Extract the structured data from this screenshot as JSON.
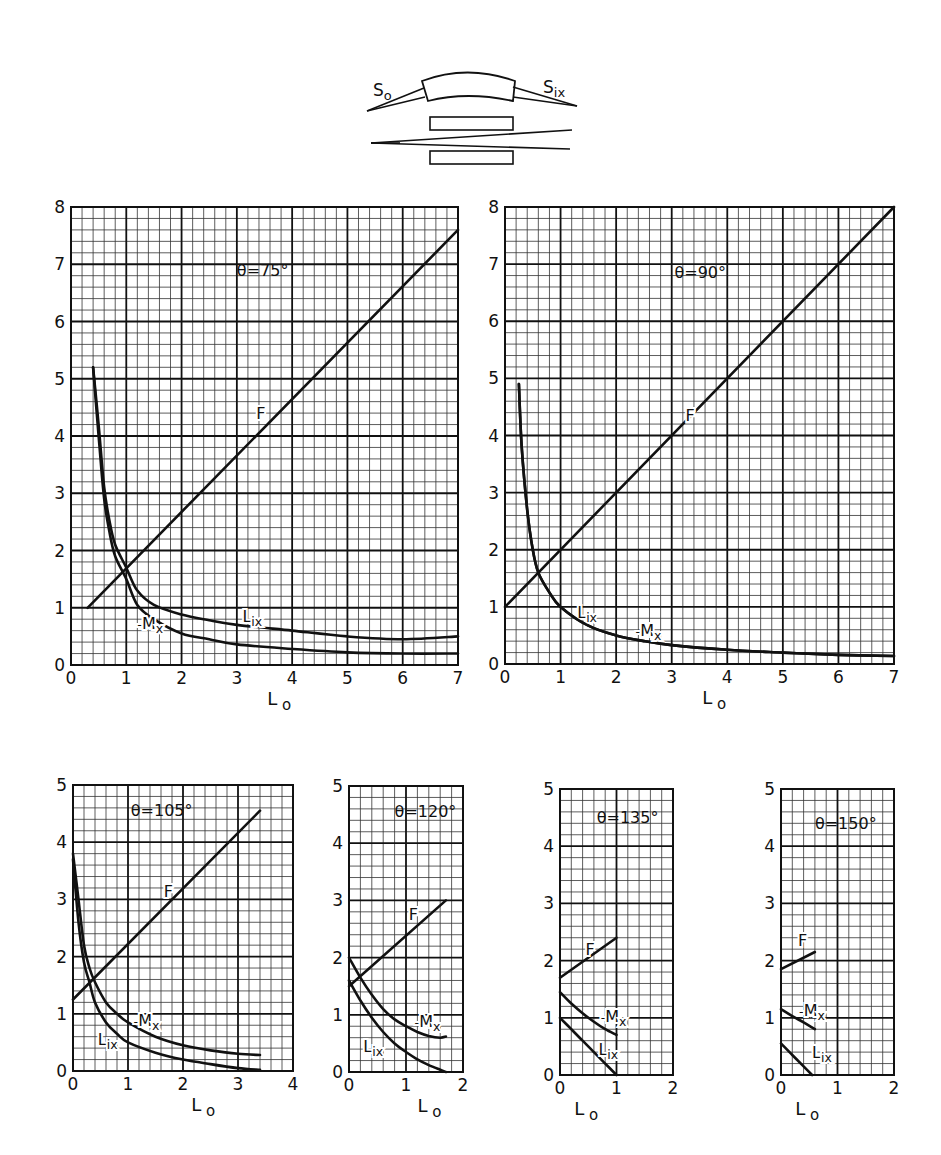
{
  "figure": {
    "width": 941,
    "height": 1155,
    "ink_color": "#111111",
    "background": "#ffffff"
  },
  "schematic": {
    "label_source": "S",
    "label_source_sub": "o",
    "label_image": "S",
    "label_image_sub": "ix"
  },
  "chart_data": [
    {
      "type": "line",
      "id": "theta75",
      "title": "θ=75°",
      "title_pos": [
        3.0,
        6.8
      ],
      "xlabel": "L",
      "xlabel_sub": "o",
      "ylabel": "",
      "xlim": [
        0,
        7
      ],
      "ylim": [
        0,
        8
      ],
      "xticks": [
        0,
        1,
        2,
        3,
        4,
        5,
        6,
        7
      ],
      "yticks": [
        0,
        1,
        2,
        3,
        4,
        5,
        6,
        7,
        8
      ],
      "minor_per_major": 5,
      "grid": true,
      "frame": [
        71,
        207,
        458,
        665
      ],
      "series": [
        {
          "name": "F",
          "label_pos": [
            3.35,
            4.3
          ],
          "points": [
            [
              0.3,
              1.0
            ],
            [
              7.0,
              7.6
            ]
          ]
        },
        {
          "name": "L_ix",
          "label_pos": [
            3.1,
            0.75
          ],
          "points": [
            [
              0.4,
              5.2
            ],
            [
              0.5,
              4.2
            ],
            [
              0.6,
              3.1
            ],
            [
              0.7,
              2.5
            ],
            [
              0.8,
              2.1
            ],
            [
              1.0,
              1.7
            ],
            [
              1.2,
              1.3
            ],
            [
              1.5,
              1.05
            ],
            [
              2.0,
              0.88
            ],
            [
              2.5,
              0.78
            ],
            [
              3.0,
              0.7
            ],
            [
              4.0,
              0.6
            ],
            [
              5.0,
              0.5
            ],
            [
              6.0,
              0.45
            ],
            [
              7.0,
              0.5
            ]
          ]
        },
        {
          "name": "-M_x",
          "label_pos": [
            1.2,
            0.6
          ],
          "points": [
            [
              0.4,
              5.2
            ],
            [
              0.5,
              4.0
            ],
            [
              0.6,
              2.9
            ],
            [
              0.7,
              2.3
            ],
            [
              0.8,
              1.9
            ],
            [
              1.0,
              1.5
            ],
            [
              1.2,
              1.05
            ],
            [
              1.5,
              0.8
            ],
            [
              2.0,
              0.55
            ],
            [
              2.5,
              0.45
            ],
            [
              3.0,
              0.36
            ],
            [
              4.0,
              0.28
            ],
            [
              5.0,
              0.22
            ],
            [
              6.0,
              0.2
            ],
            [
              7.0,
              0.2
            ]
          ]
        }
      ]
    },
    {
      "type": "line",
      "id": "theta90",
      "title": "θ=90°",
      "title_pos": [
        3.05,
        6.75
      ],
      "xlabel": "L",
      "xlabel_sub": "o",
      "ylabel": "",
      "xlim": [
        0,
        7
      ],
      "ylim": [
        0,
        8
      ],
      "xticks": [
        0,
        1,
        2,
        3,
        4,
        5,
        6,
        7
      ],
      "yticks": [
        0,
        1,
        2,
        3,
        4,
        5,
        6,
        7,
        8
      ],
      "minor_per_major": 5,
      "grid": true,
      "frame": [
        505,
        207,
        894,
        664
      ],
      "series": [
        {
          "name": "F",
          "label_pos": [
            3.25,
            4.25
          ],
          "points": [
            [
              0.0,
              1.0
            ],
            [
              7.0,
              8.0
            ]
          ]
        },
        {
          "name": "L_ix",
          "label_pos": [
            1.3,
            0.8
          ],
          "points": [
            [
              0.25,
              4.9
            ],
            [
              0.3,
              3.8
            ],
            [
              0.4,
              2.7
            ],
            [
              0.5,
              2.0
            ],
            [
              0.6,
              1.6
            ],
            [
              0.8,
              1.25
            ],
            [
              1.0,
              1.0
            ],
            [
              1.5,
              0.67
            ],
            [
              2.0,
              0.5
            ],
            [
              2.5,
              0.4
            ],
            [
              3.0,
              0.33
            ],
            [
              4.0,
              0.25
            ],
            [
              5.0,
              0.2
            ],
            [
              6.0,
              0.16
            ],
            [
              7.0,
              0.14
            ]
          ]
        },
        {
          "name": "-M_x",
          "label_pos": [
            2.35,
            0.45
          ],
          "points": [
            [
              0.25,
              4.9
            ],
            [
              0.3,
              3.8
            ],
            [
              0.4,
              2.7
            ],
            [
              0.5,
              2.0
            ],
            [
              0.6,
              1.6
            ],
            [
              0.8,
              1.25
            ],
            [
              1.0,
              1.0
            ],
            [
              1.5,
              0.67
            ],
            [
              2.0,
              0.5
            ],
            [
              2.5,
              0.4
            ],
            [
              3.0,
              0.33
            ],
            [
              4.0,
              0.25
            ],
            [
              5.0,
              0.2
            ],
            [
              6.0,
              0.16
            ],
            [
              7.0,
              0.14
            ]
          ]
        }
      ]
    },
    {
      "type": "line",
      "id": "theta105",
      "title": "θ=105°",
      "title_pos": [
        1.05,
        4.45
      ],
      "xlabel": "L",
      "xlabel_sub": "o",
      "ylabel": "",
      "xlim": [
        0,
        4
      ],
      "ylim": [
        0,
        5
      ],
      "xticks": [
        0,
        1,
        2,
        3,
        4
      ],
      "yticks": [
        0,
        1,
        2,
        3,
        4,
        5
      ],
      "minor_per_major": 5,
      "grid": true,
      "frame": [
        73,
        785,
        293,
        1071
      ],
      "series": [
        {
          "name": "F",
          "label_pos": [
            1.65,
            3.05
          ],
          "points": [
            [
              0.0,
              1.25
            ],
            [
              3.4,
              4.55
            ]
          ]
        },
        {
          "name": "-M_x",
          "label_pos": [
            1.1,
            0.75
          ],
          "points": [
            [
              0.0,
              3.8
            ],
            [
              0.1,
              3.0
            ],
            [
              0.2,
              2.2
            ],
            [
              0.3,
              1.8
            ],
            [
              0.4,
              1.55
            ],
            [
              0.6,
              1.2
            ],
            [
              0.8,
              1.0
            ],
            [
              1.0,
              0.85
            ],
            [
              1.5,
              0.6
            ],
            [
              2.0,
              0.45
            ],
            [
              2.5,
              0.36
            ],
            [
              3.0,
              0.3
            ],
            [
              3.4,
              0.28
            ]
          ]
        },
        {
          "name": "L_ix",
          "label_pos": [
            0.45,
            0.45
          ],
          "points": [
            [
              0.0,
              3.7
            ],
            [
              0.1,
              2.6
            ],
            [
              0.2,
              1.9
            ],
            [
              0.3,
              1.55
            ],
            [
              0.4,
              1.2
            ],
            [
              0.6,
              0.85
            ],
            [
              0.8,
              0.65
            ],
            [
              1.0,
              0.5
            ],
            [
              1.5,
              0.32
            ],
            [
              2.0,
              0.2
            ],
            [
              2.5,
              0.12
            ],
            [
              3.0,
              0.05
            ],
            [
              3.4,
              0.02
            ]
          ]
        }
      ]
    },
    {
      "type": "line",
      "id": "theta120",
      "title": "θ=120°",
      "title_pos": [
        0.8,
        4.45
      ],
      "xlabel": "L",
      "xlabel_sub": "o",
      "ylabel": "",
      "xlim": [
        0,
        2
      ],
      "ylim": [
        0,
        5
      ],
      "xticks": [
        0,
        1,
        2
      ],
      "yticks": [
        0,
        1,
        2,
        3,
        4,
        5
      ],
      "minor_per_major": 5,
      "grid": true,
      "frame": [
        349,
        786,
        463,
        1072
      ],
      "series": [
        {
          "name": "F",
          "label_pos": [
            1.05,
            2.65
          ],
          "points": [
            [
              0.0,
              1.5
            ],
            [
              1.7,
              3.0
            ]
          ]
        },
        {
          "name": "-M_x",
          "label_pos": [
            1.15,
            0.75
          ],
          "points": [
            [
              0.0,
              2.0
            ],
            [
              0.2,
              1.65
            ],
            [
              0.4,
              1.35
            ],
            [
              0.6,
              1.1
            ],
            [
              0.8,
              0.92
            ],
            [
              1.0,
              0.8
            ],
            [
              1.2,
              0.7
            ],
            [
              1.4,
              0.63
            ],
            [
              1.6,
              0.6
            ],
            [
              1.7,
              0.62
            ]
          ]
        },
        {
          "name": "L_ix",
          "label_pos": [
            0.25,
            0.35
          ],
          "points": [
            [
              0.0,
              1.6
            ],
            [
              0.2,
              1.25
            ],
            [
              0.4,
              0.95
            ],
            [
              0.6,
              0.7
            ],
            [
              0.8,
              0.5
            ],
            [
              1.0,
              0.35
            ],
            [
              1.2,
              0.22
            ],
            [
              1.4,
              0.12
            ],
            [
              1.6,
              0.04
            ],
            [
              1.7,
              0.0
            ]
          ]
        }
      ]
    },
    {
      "type": "line",
      "id": "theta135",
      "title": "θ=135°",
      "title_pos": [
        0.65,
        4.4
      ],
      "xlabel": "L",
      "xlabel_sub": "o",
      "ylabel": "",
      "xlim": [
        0,
        2
      ],
      "ylim": [
        0,
        5
      ],
      "xticks": [
        0,
        1,
        2
      ],
      "yticks": [
        0,
        1,
        2,
        3,
        4,
        5
      ],
      "minor_per_major": 5,
      "grid": true,
      "frame": [
        560,
        789,
        673,
        1075
      ],
      "series": [
        {
          "name": "F",
          "label_pos": [
            0.45,
            2.1
          ],
          "points": [
            [
              0.0,
              1.7
            ],
            [
              1.0,
              2.4
            ]
          ]
        },
        {
          "name": "-M_x",
          "label_pos": [
            0.72,
            0.9
          ],
          "points": [
            [
              0.0,
              1.45
            ],
            [
              0.2,
              1.25
            ],
            [
              0.4,
              1.08
            ],
            [
              0.6,
              0.93
            ],
            [
              0.8,
              0.8
            ],
            [
              1.0,
              0.7
            ]
          ]
        },
        {
          "name": "L_ix",
          "label_pos": [
            0.68,
            0.35
          ],
          "points": [
            [
              0.0,
              1.0
            ],
            [
              0.2,
              0.8
            ],
            [
              0.4,
              0.6
            ],
            [
              0.6,
              0.4
            ],
            [
              0.8,
              0.2
            ],
            [
              1.0,
              0.0
            ]
          ]
        }
      ]
    },
    {
      "type": "line",
      "id": "theta150",
      "title": "θ=150°",
      "title_pos": [
        0.6,
        4.3
      ],
      "xlabel": "L",
      "xlabel_sub": "o",
      "ylabel": "",
      "xlim": [
        0,
        2
      ],
      "ylim": [
        0,
        5
      ],
      "xticks": [
        0,
        1,
        2
      ],
      "yticks": [
        0,
        1,
        2,
        3,
        4,
        5
      ],
      "minor_per_major": 5,
      "grid": true,
      "frame": [
        781,
        789,
        894,
        1075
      ],
      "series": [
        {
          "name": "F",
          "label_pos": [
            0.3,
            2.25
          ],
          "points": [
            [
              0.0,
              1.85
            ],
            [
              0.6,
              2.15
            ]
          ]
        },
        {
          "name": "-M_x",
          "label_pos": [
            0.32,
            1.0
          ],
          "points": [
            [
              0.0,
              1.15
            ],
            [
              0.2,
              1.03
            ],
            [
              0.4,
              0.92
            ],
            [
              0.6,
              0.8
            ]
          ]
        },
        {
          "name": "L_ix",
          "label_pos": [
            0.55,
            0.3
          ],
          "points": [
            [
              0.0,
              0.55
            ],
            [
              0.2,
              0.35
            ],
            [
              0.4,
              0.15
            ],
            [
              0.55,
              0.0
            ]
          ]
        }
      ]
    }
  ]
}
